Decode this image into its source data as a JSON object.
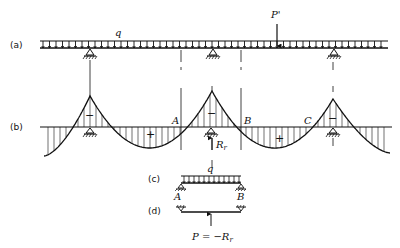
{
  "diagram": {
    "type": "structural-beam-moment-diagram",
    "parts": {
      "a": {
        "label": "(a)",
        "load_label": "q",
        "point_load_label": "P'",
        "supports_x": [
          90,
          213,
          334
        ],
        "section_lines_x": [
          181,
          241
        ]
      },
      "b": {
        "label": "(b)",
        "signs": [
          "−",
          "+",
          "−",
          "+",
          "−"
        ],
        "points": [
          "A",
          "B",
          "C"
        ],
        "reaction_label": "R",
        "reaction_subscript": "r"
      },
      "c": {
        "label": "(c)",
        "load_label": "q",
        "left_end": "A",
        "right_end": "B"
      },
      "d": {
        "label": "(d)",
        "force_label": "P = −R",
        "force_subscript": "r"
      }
    }
  },
  "colors": {
    "line": "#111111",
    "background": "#ffffff"
  }
}
